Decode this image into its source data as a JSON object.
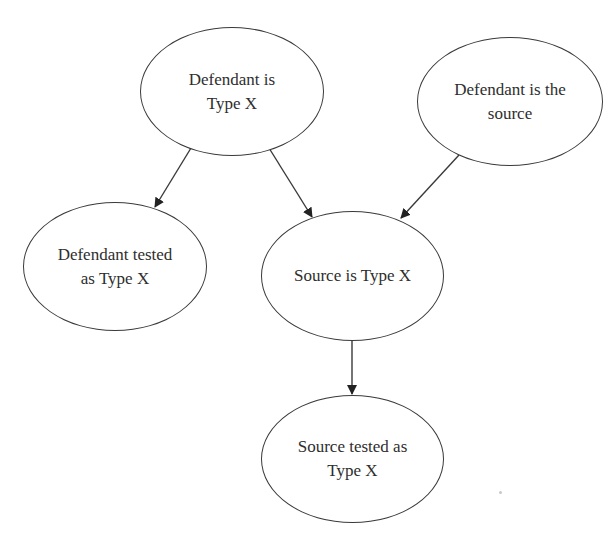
{
  "diagram": {
    "type": "directed-graph",
    "nodes": [
      {
        "id": "defendant_type_x",
        "label": "Defendant is\nType X"
      },
      {
        "id": "defendant_is_source",
        "label": "Defendant is the\nsource"
      },
      {
        "id": "defendant_tested",
        "label": "Defendant tested\nas Type X"
      },
      {
        "id": "source_type_x",
        "label": "Source is Type X"
      },
      {
        "id": "source_tested",
        "label": "Source tested as\nType X"
      }
    ],
    "edges": [
      {
        "from": "defendant_type_x",
        "to": "defendant_tested"
      },
      {
        "from": "defendant_type_x",
        "to": "source_type_x"
      },
      {
        "from": "defendant_is_source",
        "to": "source_type_x"
      },
      {
        "from": "source_type_x",
        "to": "source_tested"
      }
    ],
    "colors": {
      "stroke": "#3a3a3a",
      "text": "#2e2e2e",
      "background": "#ffffff"
    }
  }
}
